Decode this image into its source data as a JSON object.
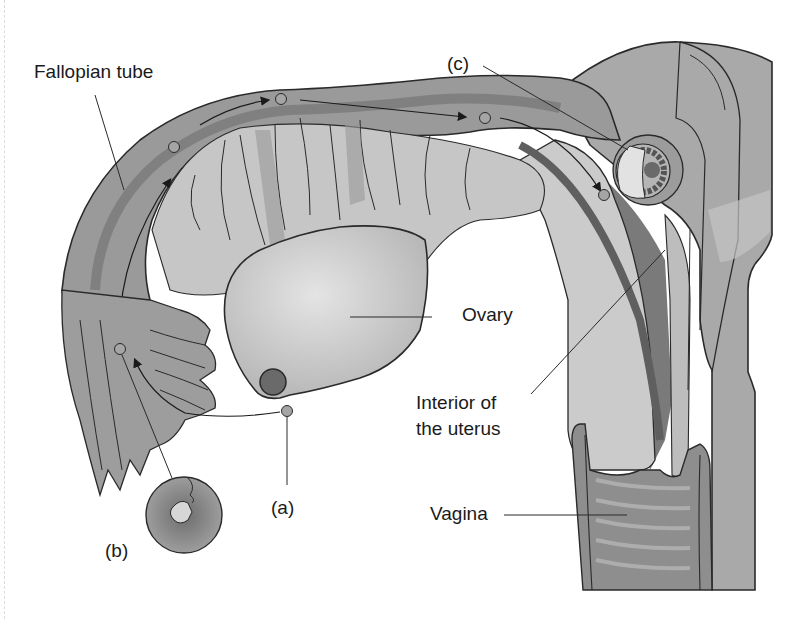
{
  "figure": {
    "colors": {
      "background": "#ffffff",
      "tissue_light": "#c9c9c9",
      "tissue_mid": "#a8a8a8",
      "tissue_dark": "#8a8a8a",
      "tissue_darker": "#6f6f6f",
      "outline": "#2a2a2a",
      "label_text": "#1a1a1a"
    }
  },
  "labels": {
    "fallopian_tube": "Fallopian tube",
    "ovary": "Ovary",
    "interior_uterus_line1": "Interior of",
    "interior_uterus_line2": "the uterus",
    "vagina": "Vagina",
    "a": "(a)",
    "b": "(b)",
    "c": "(c)"
  },
  "stages": [
    {
      "key": "a",
      "meaning": "ovulation - egg released from ovary"
    },
    {
      "key": "b",
      "meaning": "fertilization in fallopian tube"
    },
    {
      "key": "c",
      "meaning": "implantation in uterine wall"
    }
  ]
}
